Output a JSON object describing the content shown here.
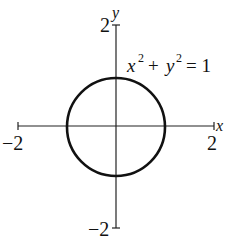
{
  "figure": {
    "equation": {
      "x": "x",
      "y": "y",
      "exp": "2",
      "plus": "+",
      "eq": "= 1"
    },
    "x_axis": {
      "label": "x",
      "min_label": "−2",
      "max_label": "2",
      "min": -2,
      "max": 2
    },
    "y_axis": {
      "label": "y",
      "min_label": "−2",
      "max_label": "2",
      "min": -2,
      "max": 2
    },
    "curve": {
      "type": "circle",
      "center": [
        0,
        0
      ],
      "radius": 1
    },
    "colors": {
      "stroke": "#111111",
      "background": "#ffffff"
    }
  }
}
